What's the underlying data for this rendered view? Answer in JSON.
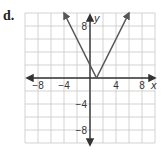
{
  "problem_label": "d.",
  "chart_data": {
    "type": "line",
    "title": "",
    "function": "y = 2|x - 1|",
    "xlabel": "x",
    "ylabel": "y",
    "xlim": [
      -10,
      10
    ],
    "ylim": [
      -10,
      10
    ],
    "grid": true,
    "grid_step": 2,
    "x_tick_labels": [
      "-8",
      "-4",
      "4",
      "8"
    ],
    "y_tick_labels": [
      "8",
      "-4",
      "-8"
    ],
    "series": [
      {
        "name": "absolute value graph",
        "x": [
          -4,
          -3,
          -2,
          -1,
          0,
          1,
          2,
          3,
          4,
          5,
          6
        ],
        "y": [
          10,
          8,
          6,
          4,
          2,
          0,
          2,
          4,
          6,
          8,
          10
        ],
        "vertex": [
          1,
          0
        ],
        "arrows": "both ends",
        "color": "#555555"
      }
    ],
    "legend": null
  }
}
